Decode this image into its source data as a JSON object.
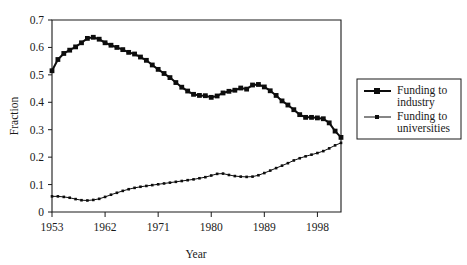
{
  "chart_data": {
    "type": "line",
    "title": "",
    "xlabel": "Year",
    "ylabel": "Fraction",
    "xlim": [
      1953,
      2002
    ],
    "ylim": [
      0,
      0.7
    ],
    "grid": false,
    "legend_position": "right-outside",
    "x_ticks": [
      "1953",
      "1962",
      "1971",
      "1980",
      "1989",
      "1998"
    ],
    "x_tick_values": [
      1953,
      1962,
      1971,
      1980,
      1989,
      1998
    ],
    "y_ticks": [
      "0",
      "0.1",
      "0.2",
      "0.3",
      "0.4",
      "0.5",
      "0.6",
      "0.7"
    ],
    "y_tick_values": [
      0,
      0.1,
      0.2,
      0.3,
      0.4,
      0.5,
      0.6,
      0.7
    ],
    "x": [
      1953,
      1954,
      1955,
      1956,
      1957,
      1958,
      1959,
      1960,
      1961,
      1962,
      1963,
      1964,
      1965,
      1966,
      1967,
      1968,
      1969,
      1970,
      1971,
      1972,
      1973,
      1974,
      1975,
      1976,
      1977,
      1978,
      1979,
      1980,
      1981,
      1982,
      1983,
      1984,
      1985,
      1986,
      1987,
      1988,
      1989,
      1990,
      1991,
      1992,
      1993,
      1994,
      1995,
      1996,
      1997,
      1998,
      1999,
      2000,
      2001,
      2002
    ],
    "series": [
      {
        "name": "Funding to industry",
        "marker": "square",
        "line_width": 2.0,
        "values": [
          0.515,
          0.556,
          0.578,
          0.59,
          0.602,
          0.617,
          0.633,
          0.637,
          0.63,
          0.617,
          0.608,
          0.6,
          0.592,
          0.582,
          0.576,
          0.565,
          0.553,
          0.536,
          0.52,
          0.505,
          0.49,
          0.472,
          0.455,
          0.441,
          0.429,
          0.425,
          0.424,
          0.418,
          0.423,
          0.434,
          0.44,
          0.444,
          0.452,
          0.448,
          0.463,
          0.465,
          0.456,
          0.442,
          0.425,
          0.405,
          0.39,
          0.373,
          0.355,
          0.345,
          0.345,
          0.343,
          0.34,
          0.325,
          0.295,
          0.272
        ]
      },
      {
        "name": "Funding to universities",
        "marker": "square-small",
        "line_width": 1.0,
        "values": [
          0.057,
          0.057,
          0.055,
          0.052,
          0.047,
          0.043,
          0.042,
          0.044,
          0.048,
          0.055,
          0.063,
          0.07,
          0.077,
          0.083,
          0.088,
          0.092,
          0.095,
          0.098,
          0.101,
          0.104,
          0.107,
          0.11,
          0.113,
          0.116,
          0.119,
          0.123,
          0.127,
          0.133,
          0.139,
          0.14,
          0.135,
          0.131,
          0.129,
          0.128,
          0.129,
          0.134,
          0.142,
          0.151,
          0.16,
          0.169,
          0.178,
          0.188,
          0.196,
          0.203,
          0.209,
          0.215,
          0.222,
          0.232,
          0.243,
          0.252
        ]
      }
    ]
  },
  "axes": {
    "y_axis_title": "Fraction",
    "x_axis_title": "Year"
  },
  "legend": {
    "items": [
      {
        "label_line1": "Funding to",
        "label_line2": "industry"
      },
      {
        "label_line1": "Funding to",
        "label_line2": "universities"
      }
    ]
  },
  "colors": {
    "ink": "#0d0d0d",
    "axis": "#1a1a1a",
    "background": "#ffffff"
  }
}
